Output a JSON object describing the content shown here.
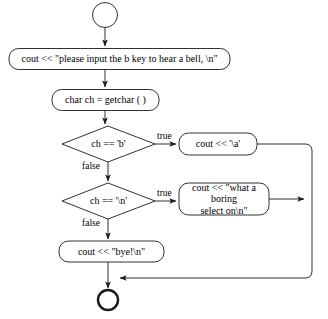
{
  "diagram": {
    "type": "flowchart",
    "stroke_color": "#1a1a1a",
    "fill_color": "#ffffff",
    "background": "#ffffff"
  },
  "nodes": {
    "start": {
      "shape": "circle",
      "label": ""
    },
    "prompt": {
      "shape": "rounded-rect",
      "label": "cout << \"please input the b key to hear a bell, \\n\""
    },
    "read_char": {
      "shape": "rounded-rect",
      "label": "char ch = getchar ( )"
    },
    "decision_b": {
      "shape": "diamond",
      "label": "ch == 'b'"
    },
    "bell": {
      "shape": "rounded-rect",
      "label": "cout << '\\a'"
    },
    "decision_n": {
      "shape": "diamond",
      "label": "ch == '\\n'"
    },
    "boring": {
      "shape": "rounded-rect",
      "label": "cout << \"what a boring\nselect on\\n\""
    },
    "bye": {
      "shape": "rounded-rect",
      "label": "cout << \"bye!\\n\""
    },
    "end": {
      "shape": "circle-bold",
      "label": ""
    }
  },
  "edges": {
    "start_to_prompt": {
      "label": ""
    },
    "prompt_to_read": {
      "label": ""
    },
    "read_to_decision_b": {
      "label": ""
    },
    "decision_b_true": {
      "label": "true"
    },
    "decision_b_false": {
      "label": "false"
    },
    "decision_n_true": {
      "label": "true"
    },
    "decision_n_false": {
      "label": "false"
    },
    "bell_to_merge": {
      "label": ""
    },
    "boring_to_merge": {
      "label": ""
    },
    "bye_to_end": {
      "label": ""
    },
    "merge_to_end": {
      "label": ""
    }
  }
}
